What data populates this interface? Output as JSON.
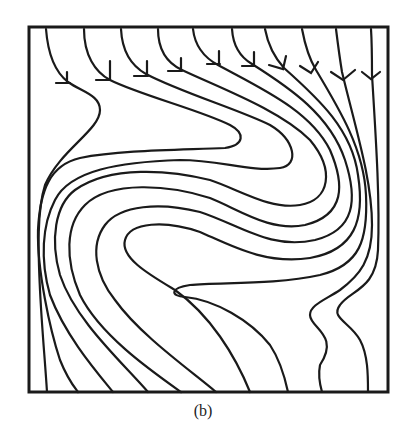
{
  "figure": {
    "caption": "(b)",
    "stroke_color": "#1a1a1a",
    "background": "#ffffff",
    "box": {
      "x": 29,
      "y": 27,
      "width": 359,
      "height": 365
    },
    "streamline_count": 10,
    "entry_x_top": [
      46,
      84,
      121,
      158,
      193,
      232,
      265,
      302,
      336,
      371
    ],
    "exit_x_bottom": [
      47,
      78,
      113,
      148,
      181,
      216,
      250,
      288,
      322,
      368
    ]
  }
}
